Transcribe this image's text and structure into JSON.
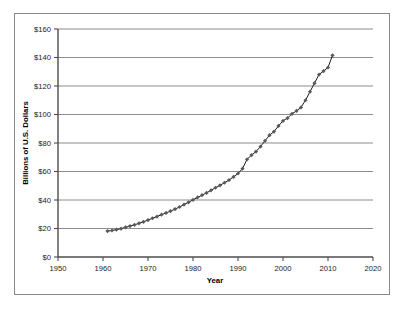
{
  "chart_data": {
    "type": "scatter",
    "title": "",
    "xlabel": "Year",
    "ylabel": "Billions of U.S. Dollars",
    "xlim": [
      1950,
      2020
    ],
    "ylim": [
      0,
      160
    ],
    "grid": "horizontal",
    "legend": "none",
    "xticks": [
      "1950",
      "1960",
      "1970",
      "1980",
      "1990",
      "2000",
      "2010",
      "2020"
    ],
    "xtick_values": [
      1950,
      1960,
      1970,
      1980,
      1990,
      2000,
      2010,
      2020
    ],
    "yticks": [
      "$0",
      "$20",
      "$40",
      "$60",
      "$80",
      "$100",
      "$120",
      "$140",
      "$160"
    ],
    "ytick_values": [
      0,
      20,
      40,
      60,
      80,
      100,
      120,
      140,
      160
    ],
    "marker": "diamond",
    "marker_color": "#595959",
    "line_color": "#1a1a1a",
    "series": [
      {
        "name": "Billions of U.S. Dollars",
        "x": [
          1961,
          1962,
          1963,
          1964,
          1965,
          1966,
          1967,
          1968,
          1969,
          1970,
          1971,
          1972,
          1973,
          1974,
          1975,
          1976,
          1977,
          1978,
          1979,
          1980,
          1981,
          1982,
          1983,
          1984,
          1985,
          1986,
          1987,
          1988,
          1989,
          1990,
          1991,
          1992,
          1993,
          1994,
          1995,
          1996,
          1997,
          1998,
          1999,
          2000,
          2001,
          2002,
          2003,
          2004,
          2005,
          2006,
          2007,
          2008,
          2009,
          2010,
          2011
        ],
        "values": [
          18.2,
          18.6,
          19.2,
          19.9,
          20.8,
          21.7,
          22.6,
          23.6,
          24.7,
          25.9,
          27.2,
          28.4,
          29.7,
          30.9,
          32.2,
          33.6,
          35.1,
          36.8,
          38.4,
          40.1,
          41.8,
          43.4,
          45.0,
          46.8,
          48.6,
          50.3,
          52.1,
          54.0,
          56.2,
          58.6,
          62.0,
          68.5,
          71.5,
          74.0,
          77.5,
          81.5,
          85.5,
          88.0,
          92.0,
          95.5,
          97.5,
          100.5,
          102.5,
          105.0,
          110.0,
          116.0,
          122.0,
          128.0,
          130.5,
          133.0,
          141.5
        ]
      }
    ]
  }
}
